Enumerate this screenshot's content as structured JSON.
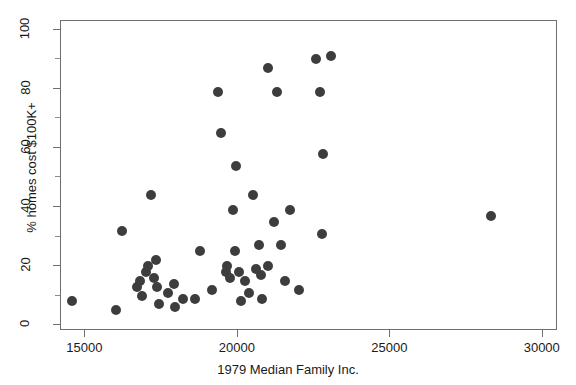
{
  "chart_data": {
    "type": "scatter",
    "title": "",
    "xlabel": "1979 Median Family Inc.",
    "ylabel": "% homes cost $100K+",
    "xlim": [
      14200,
      30500
    ],
    "ylim": [
      -2,
      103
    ],
    "grid": false,
    "legend": null,
    "marker": {
      "shape": "circle",
      "color": "#3d3d3d",
      "size_px": 10
    },
    "xticks": [
      15000,
      20000,
      25000,
      30000
    ],
    "xtick_labels": [
      "15000",
      "20000",
      "25000",
      "30000"
    ],
    "yticks": [
      0,
      20,
      40,
      60,
      80,
      100
    ],
    "ytick_labels": [
      "0",
      "20",
      "40",
      "60",
      "80",
      "100"
    ],
    "yticks_minor": [
      10,
      30,
      50,
      70,
      90
    ],
    "points": [
      {
        "x": 14550,
        "y": 8
      },
      {
        "x": 16000,
        "y": 5
      },
      {
        "x": 16200,
        "y": 32
      },
      {
        "x": 16700,
        "y": 13
      },
      {
        "x": 16800,
        "y": 15
      },
      {
        "x": 16850,
        "y": 10
      },
      {
        "x": 17000,
        "y": 18
      },
      {
        "x": 17050,
        "y": 20
      },
      {
        "x": 17150,
        "y": 44
      },
      {
        "x": 17250,
        "y": 16
      },
      {
        "x": 17300,
        "y": 22
      },
      {
        "x": 17350,
        "y": 13
      },
      {
        "x": 17400,
        "y": 7
      },
      {
        "x": 17700,
        "y": 11
      },
      {
        "x": 17900,
        "y": 14
      },
      {
        "x": 17950,
        "y": 6
      },
      {
        "x": 18200,
        "y": 9
      },
      {
        "x": 18600,
        "y": 9
      },
      {
        "x": 18750,
        "y": 25
      },
      {
        "x": 19150,
        "y": 12
      },
      {
        "x": 19350,
        "y": 79
      },
      {
        "x": 19450,
        "y": 65
      },
      {
        "x": 19600,
        "y": 18
      },
      {
        "x": 19650,
        "y": 20
      },
      {
        "x": 19750,
        "y": 16
      },
      {
        "x": 19850,
        "y": 39
      },
      {
        "x": 19900,
        "y": 25
      },
      {
        "x": 19950,
        "y": 54
      },
      {
        "x": 20050,
        "y": 18
      },
      {
        "x": 20100,
        "y": 8
      },
      {
        "x": 20250,
        "y": 15
      },
      {
        "x": 20350,
        "y": 11
      },
      {
        "x": 20500,
        "y": 44
      },
      {
        "x": 20600,
        "y": 19
      },
      {
        "x": 20700,
        "y": 27
      },
      {
        "x": 20750,
        "y": 17
      },
      {
        "x": 20800,
        "y": 9
      },
      {
        "x": 21000,
        "y": 87
      },
      {
        "x": 21000,
        "y": 20
      },
      {
        "x": 21200,
        "y": 35
      },
      {
        "x": 21300,
        "y": 79
      },
      {
        "x": 21400,
        "y": 27
      },
      {
        "x": 21550,
        "y": 15
      },
      {
        "x": 21700,
        "y": 39
      },
      {
        "x": 22000,
        "y": 12
      },
      {
        "x": 22550,
        "y": 90
      },
      {
        "x": 22700,
        "y": 79
      },
      {
        "x": 22750,
        "y": 31
      },
      {
        "x": 22800,
        "y": 58
      },
      {
        "x": 23050,
        "y": 91
      },
      {
        "x": 28300,
        "y": 37
      }
    ]
  },
  "axes": {
    "x_title": "1979 Median Family Inc.",
    "y_title": "% homes cost $100K+"
  }
}
